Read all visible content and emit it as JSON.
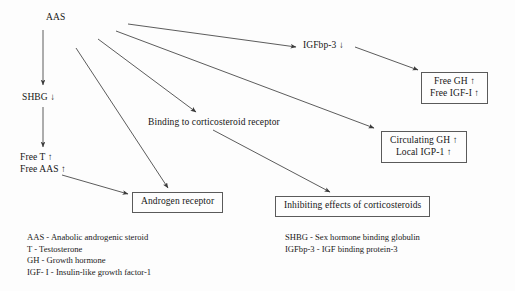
{
  "figure": {
    "type": "flow-diagram",
    "background": "#fdfdfd",
    "line_color": "#4a4a4a",
    "text_color": "#161616"
  },
  "nodes": {
    "aas": {
      "label": "AAS",
      "x": 46,
      "y": 12
    },
    "shbg": {
      "label": "SHBG ↓",
      "x": 22,
      "y": 92
    },
    "free_t": {
      "line1": "Free T ↑",
      "line2": "Free AAS ↑",
      "x": 20,
      "y": 152
    },
    "igfbp3": {
      "label": "IGFbp-3 ↓",
      "x": 303,
      "y": 40
    },
    "binding": {
      "label": "Binding to corticosteroid receptor",
      "x": 148,
      "y": 117
    },
    "androgen_receptor": {
      "label": "Androgen receptor",
      "x": 132,
      "y": 192
    },
    "inhibiting": {
      "label": "Inhibiting effects of corticosteroids",
      "x": 275,
      "y": 196
    },
    "free_gh": {
      "line1": "Free GH ↑",
      "line2": "Free IGF-I ↑",
      "x": 421,
      "y": 72
    },
    "circulating_gh": {
      "line1": "Circulating GH ↑",
      "line2": "Local IGP-1 ↑",
      "x": 381,
      "y": 131
    }
  },
  "edges": [
    {
      "name": "aas-to-igfbp3",
      "from": "AAS",
      "to": "IGFbp-3",
      "x1": 128,
      "y1": 24,
      "x2": 296,
      "y2": 47
    },
    {
      "name": "aas-to-circulating-gh",
      "from": "AAS",
      "to": "Circulating GH / Local IGP-1",
      "x1": 116,
      "y1": 31,
      "x2": 374,
      "y2": 128
    },
    {
      "name": "aas-to-binding",
      "from": "AAS",
      "to": "Binding to corticosteroid receptor",
      "x1": 98,
      "y1": 39,
      "x2": 196,
      "y2": 112
    },
    {
      "name": "aas-to-androgen-receptor",
      "from": "AAS",
      "to": "Androgen receptor",
      "x1": 76,
      "y1": 48,
      "x2": 168,
      "y2": 188
    },
    {
      "name": "aas-to-shbg",
      "from": "AAS",
      "to": "SHBG",
      "x1": 43,
      "y1": 30,
      "x2": 43,
      "y2": 85
    },
    {
      "name": "shbg-to-free-t",
      "from": "SHBG",
      "to": "Free T / Free AAS",
      "x1": 43,
      "y1": 107,
      "x2": 43,
      "y2": 147
    },
    {
      "name": "free-aas-to-androgen-receptor",
      "from": "Free AAS",
      "to": "Androgen receptor",
      "x1": 62,
      "y1": 175,
      "x2": 128,
      "y2": 194
    },
    {
      "name": "igfbp3-to-free-gh",
      "from": "IGFbp-3",
      "to": "Free GH / Free IGF-I",
      "x1": 355,
      "y1": 47,
      "x2": 418,
      "y2": 70
    },
    {
      "name": "binding-to-inhibiting",
      "from": "Binding to corticosteroid receptor",
      "to": "Inhibiting effects of corticosteroids",
      "x1": 213,
      "y1": 130,
      "x2": 330,
      "y2": 192
    }
  ],
  "legend_left": {
    "items": [
      "AAS - Anabolic androgenic steroid",
      "T - Testosterone",
      "GH - Growth hormone",
      "IGF- I - Insulin-like growth factor-1"
    ]
  },
  "legend_right": {
    "items": [
      "SHBG - Sex hormone binding globulin",
      "IGFbp-3 - IGF binding protein-3"
    ]
  }
}
